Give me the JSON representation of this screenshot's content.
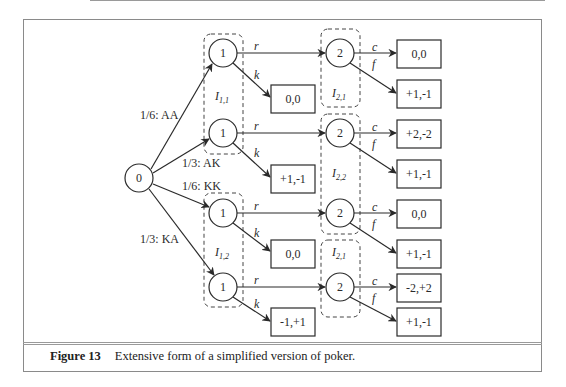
{
  "figure": {
    "number_label": "Figure 13",
    "caption": "Extensive form of a simplified version of poker."
  },
  "tree": {
    "root": {
      "label": "0"
    },
    "chance_edges": [
      {
        "label": "1/6: AA"
      },
      {
        "label": "1/3: AK"
      },
      {
        "label": "1/6: KK"
      },
      {
        "label": "1/3: KA"
      }
    ],
    "player1_nodes": [
      {
        "label": "1"
      },
      {
        "label": "1"
      },
      {
        "label": "1"
      },
      {
        "label": "1"
      }
    ],
    "player2_nodes": [
      {
        "label": "2"
      },
      {
        "label": "2"
      },
      {
        "label": "2"
      },
      {
        "label": "2"
      }
    ],
    "actions": {
      "raise": "r",
      "check": "k",
      "call": "c",
      "fold": "f"
    },
    "info_sets": {
      "p1_top": {
        "base": "I",
        "sub": "1,1"
      },
      "p1_bottom": {
        "base": "I",
        "sub": "1,2"
      },
      "p2_first": {
        "base": "I",
        "sub": "2,1"
      },
      "p2_second": {
        "base": "I",
        "sub": "2,2"
      },
      "p2_third": {
        "base": "I",
        "sub": "2,1"
      }
    },
    "check_payoffs": [
      "0,0",
      "+1,-1",
      "0,0",
      "-1,+1"
    ],
    "call_fold_payoffs": [
      {
        "call": "0,0",
        "fold": "+1,-1"
      },
      {
        "call": "+2,-2",
        "fold": "+1,-1"
      },
      {
        "call": "0,0",
        "fold": "+1,-1"
      },
      {
        "call": "-2,+2",
        "fold": "+1,-1"
      }
    ]
  }
}
